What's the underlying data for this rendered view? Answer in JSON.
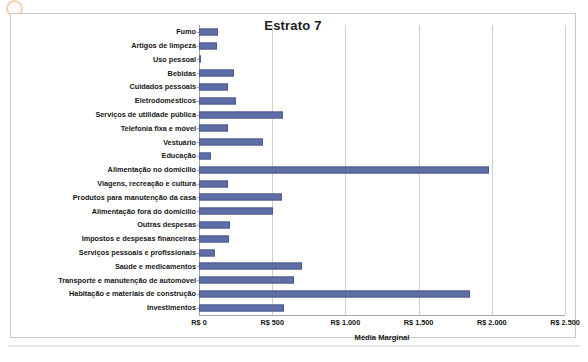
{
  "chart_data": {
    "type": "bar",
    "orientation": "horizontal",
    "title": "Estrato 7",
    "xlabel": "Média Marginal",
    "ylabel": "",
    "xlim": [
      0,
      2500
    ],
    "xticks": [
      0,
      500,
      1000,
      1500,
      2000,
      2500
    ],
    "xtick_labels": [
      "R$ 0",
      "R$ 500",
      "R$ 1.000",
      "R$ 1.500",
      "R$ 2.000",
      "R$ 2.500"
    ],
    "grid": true,
    "legend": false,
    "series_color": "#5f6ea6",
    "categories": [
      "Fumo",
      "Artigos de limpeza",
      "Uso pessoal",
      "Bebidas",
      "Cuidados pessoais",
      "Eletrodomésticos",
      "Serviços de utilidade pública",
      "Telefonia fixa e móvel",
      "Vestuário",
      "Educação",
      "Alimentação no domicílio",
      "Viagens, recreação e cultura",
      "Produtos para manutenção da casa",
      "Alimentação fora do domicílio",
      "Outras despesas",
      "Impostos e despesas financeiras",
      "Serviços pessoais e profissionais",
      "Saúde e medicamentos",
      "Transporte e manutenção de automóvel",
      "Habitação e materiais de construção",
      "Investimentos"
    ],
    "values": [
      130,
      125,
      10,
      240,
      200,
      250,
      575,
      200,
      440,
      80,
      1980,
      200,
      570,
      505,
      210,
      205,
      110,
      705,
      650,
      1850,
      580
    ]
  }
}
